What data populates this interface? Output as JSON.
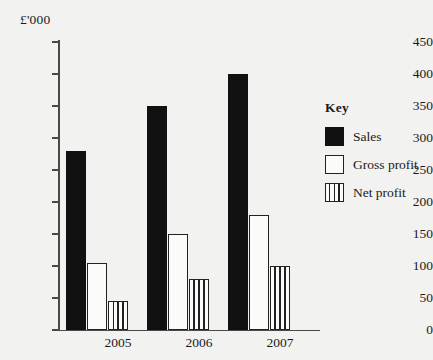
{
  "chart_data": {
    "type": "bar",
    "title": "",
    "xlabel": "",
    "ylabel": "£'000",
    "unit_label": "£'000",
    "categories": [
      "2005",
      "2006",
      "2007"
    ],
    "series": [
      {
        "name": "Sales",
        "values": [
          280,
          350,
          400
        ],
        "fill": "solid-black"
      },
      {
        "name": "Gross profit",
        "values": [
          105,
          150,
          180
        ],
        "fill": "white-outline"
      },
      {
        "name": "Net profit",
        "values": [
          45,
          80,
          100
        ],
        "fill": "vertical-stripes"
      }
    ],
    "ylim": [
      0,
      450
    ],
    "ytick_step": 50,
    "yticks": [
      "0",
      "50",
      "100",
      "150",
      "200",
      "250",
      "300",
      "350",
      "400",
      "450"
    ],
    "grid": false,
    "legend_position": "right",
    "legend_title": "Key",
    "colors": {
      "ink": "#111111",
      "axis": "#4a4a4a",
      "background": "#f2f2f0",
      "bar_face": "#fbfbf9"
    }
  },
  "legend": {
    "title": "Key",
    "items": [
      {
        "label": "Sales"
      },
      {
        "label": "Gross profit"
      },
      {
        "label": "Net profit"
      }
    ]
  }
}
